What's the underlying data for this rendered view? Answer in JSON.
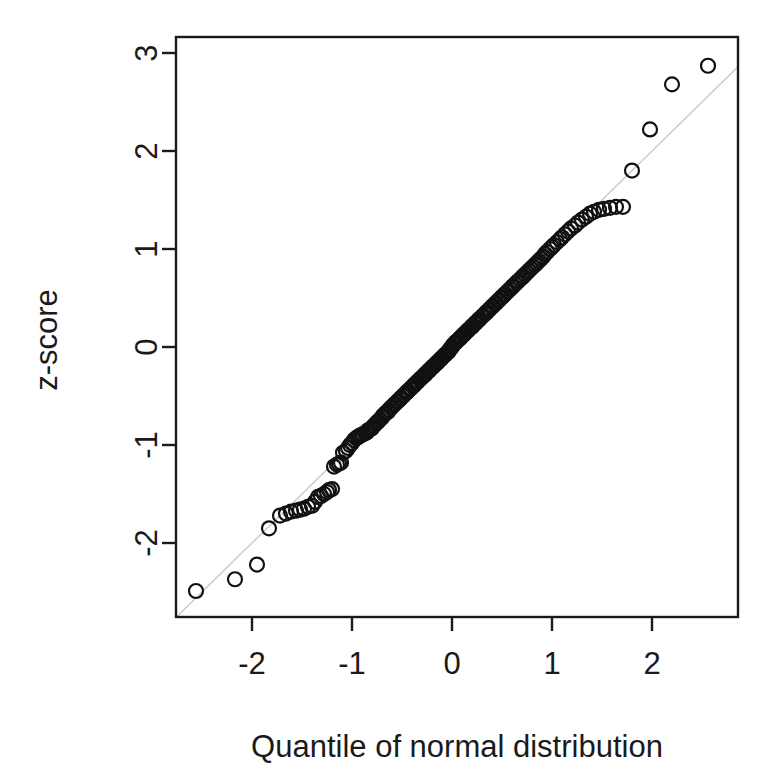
{
  "chart_data": {
    "type": "scatter",
    "title": "",
    "subtitle": "",
    "xlabel": "Quantile of normal distribution",
    "ylabel": "z-score",
    "xlim": [
      -2.76,
      2.86
    ],
    "ylim": [
      -2.78,
      3.1
    ],
    "xticks": [
      -2,
      -1,
      0,
      1,
      2
    ],
    "xtick_labels": [
      "-2",
      "-1",
      "0",
      "1",
      "2"
    ],
    "yticks": [
      -2,
      -1,
      0,
      1,
      2,
      3
    ],
    "ytick_labels": [
      "-2",
      "-1",
      "0",
      "1",
      "2",
      "3"
    ],
    "grid": false,
    "legend": null,
    "marker": {
      "shape": "open-circle",
      "radius": 7,
      "stroke": "#111111",
      "stroke_width": 2.2,
      "fill": "none"
    },
    "reference_line": {
      "description": "qqline: y = x identity reference",
      "slope": 1.0,
      "intercept": 0.0,
      "color": "#c9c9c9",
      "width": 1.4
    },
    "box_color": "#1a1a1a",
    "series": [
      {
        "name": "sample quantiles",
        "x": [
          -2.56,
          -2.17,
          -1.95,
          -1.83,
          -1.72,
          -1.66,
          -1.61,
          -1.56,
          -1.52,
          -1.48,
          -1.44,
          -1.4,
          -1.37,
          -1.34,
          -1.31,
          -1.28,
          -1.25,
          -1.23,
          -1.2,
          -1.18,
          -1.15,
          -1.13,
          -1.11,
          -1.09,
          -1.06,
          -1.04,
          -1.02,
          -1.0,
          -0.98,
          -0.96,
          -0.94,
          -0.93,
          -0.91,
          -0.89,
          -0.87,
          -0.85,
          -0.84,
          -0.82,
          -0.8,
          -0.79,
          -0.77,
          -0.75,
          -0.74,
          -0.72,
          -0.7,
          -0.69,
          -0.67,
          -0.66,
          -0.64,
          -0.63,
          -0.61,
          -0.6,
          -0.58,
          -0.57,
          -0.55,
          -0.54,
          -0.52,
          -0.51,
          -0.49,
          -0.48,
          -0.46,
          -0.45,
          -0.44,
          -0.42,
          -0.41,
          -0.39,
          -0.38,
          -0.37,
          -0.35,
          -0.34,
          -0.32,
          -0.31,
          -0.3,
          -0.28,
          -0.27,
          -0.26,
          -0.24,
          -0.23,
          -0.22,
          -0.2,
          -0.19,
          -0.18,
          -0.16,
          -0.15,
          -0.14,
          -0.12,
          -0.11,
          -0.1,
          -0.08,
          -0.07,
          -0.06,
          -0.04,
          -0.03,
          -0.02,
          0.0,
          0.01,
          0.03,
          0.04,
          0.05,
          0.07,
          0.08,
          0.09,
          0.11,
          0.12,
          0.13,
          0.15,
          0.16,
          0.17,
          0.19,
          0.2,
          0.21,
          0.23,
          0.24,
          0.26,
          0.27,
          0.28,
          0.3,
          0.31,
          0.33,
          0.34,
          0.35,
          0.37,
          0.38,
          0.4,
          0.41,
          0.43,
          0.44,
          0.46,
          0.47,
          0.49,
          0.5,
          0.52,
          0.53,
          0.55,
          0.56,
          0.58,
          0.6,
          0.61,
          0.63,
          0.65,
          0.66,
          0.68,
          0.7,
          0.71,
          0.73,
          0.75,
          0.77,
          0.79,
          0.81,
          0.83,
          0.85,
          0.87,
          0.89,
          0.91,
          0.93,
          0.95,
          0.98,
          1.0,
          1.02,
          1.05,
          1.08,
          1.1,
          1.13,
          1.16,
          1.19,
          1.23,
          1.26,
          1.3,
          1.34,
          1.38,
          1.42,
          1.47,
          1.52,
          1.58,
          1.64,
          1.71,
          1.8,
          1.98,
          2.2,
          2.56
        ],
        "y": [
          -2.49,
          -2.37,
          -2.22,
          -1.85,
          -1.72,
          -1.7,
          -1.68,
          -1.67,
          -1.66,
          -1.65,
          -1.63,
          -1.62,
          -1.58,
          -1.53,
          -1.52,
          -1.5,
          -1.48,
          -1.46,
          -1.45,
          -1.22,
          -1.2,
          -1.19,
          -1.18,
          -1.08,
          -1.06,
          -1.03,
          -1.0,
          -0.98,
          -0.95,
          -0.93,
          -0.92,
          -0.91,
          -0.9,
          -0.89,
          -0.88,
          -0.87,
          -0.85,
          -0.84,
          -0.83,
          -0.81,
          -0.79,
          -0.77,
          -0.76,
          -0.74,
          -0.72,
          -0.7,
          -0.68,
          -0.67,
          -0.66,
          -0.64,
          -0.62,
          -0.61,
          -0.59,
          -0.58,
          -0.56,
          -0.55,
          -0.53,
          -0.52,
          -0.5,
          -0.49,
          -0.47,
          -0.46,
          -0.45,
          -0.43,
          -0.42,
          -0.4,
          -0.39,
          -0.38,
          -0.36,
          -0.35,
          -0.33,
          -0.32,
          -0.31,
          -0.29,
          -0.28,
          -0.27,
          -0.25,
          -0.24,
          -0.23,
          -0.21,
          -0.2,
          -0.19,
          -0.17,
          -0.16,
          -0.15,
          -0.13,
          -0.12,
          -0.11,
          -0.09,
          -0.08,
          -0.07,
          -0.05,
          -0.04,
          -0.02,
          0.0,
          0.02,
          0.04,
          0.05,
          0.06,
          0.08,
          0.09,
          0.1,
          0.12,
          0.13,
          0.14,
          0.16,
          0.17,
          0.18,
          0.2,
          0.21,
          0.22,
          0.24,
          0.25,
          0.27,
          0.28,
          0.29,
          0.31,
          0.32,
          0.34,
          0.35,
          0.36,
          0.38,
          0.39,
          0.41,
          0.42,
          0.44,
          0.45,
          0.47,
          0.48,
          0.5,
          0.51,
          0.53,
          0.54,
          0.56,
          0.57,
          0.59,
          0.61,
          0.62,
          0.64,
          0.66,
          0.67,
          0.69,
          0.71,
          0.72,
          0.74,
          0.76,
          0.78,
          0.8,
          0.82,
          0.84,
          0.86,
          0.88,
          0.9,
          0.92,
          0.95,
          0.97,
          1.0,
          1.02,
          1.04,
          1.07,
          1.1,
          1.12,
          1.15,
          1.18,
          1.21,
          1.24,
          1.27,
          1.3,
          1.33,
          1.36,
          1.38,
          1.4,
          1.41,
          1.42,
          1.43,
          1.43,
          1.8,
          2.22,
          2.68,
          2.87
        ]
      }
    ]
  }
}
